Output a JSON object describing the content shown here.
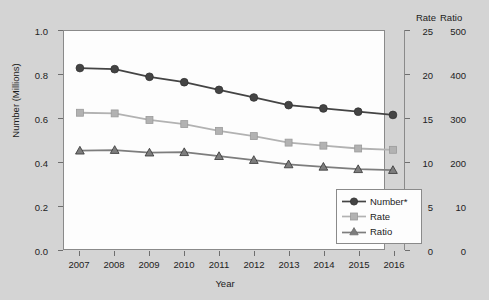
{
  "chart_data": {
    "type": "line",
    "title": "",
    "xlabel": "Year",
    "ylabel": "Number (Millions)",
    "y2label_rate": "Rate",
    "y2label_ratio": "Ratio",
    "categories": [
      "2007",
      "2008",
      "2009",
      "2010",
      "2011",
      "2012",
      "2013",
      "2014",
      "2015",
      "2016"
    ],
    "x": [
      2007,
      2008,
      2009,
      2010,
      2011,
      2012,
      2013,
      2014,
      2015,
      2016
    ],
    "ylim": [
      0.0,
      1.0
    ],
    "yticks": [
      "0.0",
      "0.2",
      "0.4",
      "0.6",
      "0.8",
      "1.0"
    ],
    "y2lim_rate": [
      0,
      25
    ],
    "y2ticks_rate": [
      "0",
      "5",
      "10",
      "15",
      "20",
      "25"
    ],
    "y2lim_ratio": [
      0,
      500
    ],
    "y2ticks_ratio": [
      "0",
      "10",
      "200",
      "300",
      "400",
      "500"
    ],
    "grid": false,
    "legend_position": "lower right",
    "series": [
      {
        "name": "Number*",
        "marker": "circle",
        "color": "#444444",
        "axis": "left",
        "values": [
          0.83,
          0.825,
          0.79,
          0.765,
          0.73,
          0.695,
          0.66,
          0.645,
          0.63,
          0.615
        ]
      },
      {
        "name": "Rate",
        "marker": "square",
        "color": "#b2b2b2",
        "axis": "right-rate",
        "values": [
          0.625,
          0.622,
          0.592,
          0.573,
          0.542,
          0.518,
          0.488,
          0.474,
          0.461,
          0.455
        ]
      },
      {
        "name": "Ratio",
        "marker": "triangle",
        "color": "#7d7d7d",
        "axis": "right-ratio",
        "values": [
          0.451,
          0.454,
          0.442,
          0.444,
          0.426,
          0.408,
          0.388,
          0.377,
          0.366,
          0.362
        ]
      }
    ]
  },
  "legend": {
    "items": [
      {
        "label": "Number*",
        "marker": "circle",
        "color": "#444444"
      },
      {
        "label": "Rate",
        "marker": "square",
        "color": "#b2b2b2"
      },
      {
        "label": "Ratio",
        "marker": "triangle",
        "color": "#7d7d7d"
      }
    ]
  },
  "colors": {
    "figure_background": "#d4d4d4",
    "plot_background": "#fdfdfd",
    "axis": "#8a8a8a",
    "text": "#1c1c1c",
    "number_series": "#444444",
    "rate_series": "#b2b2b2",
    "ratio_series": "#7d7d7d"
  }
}
